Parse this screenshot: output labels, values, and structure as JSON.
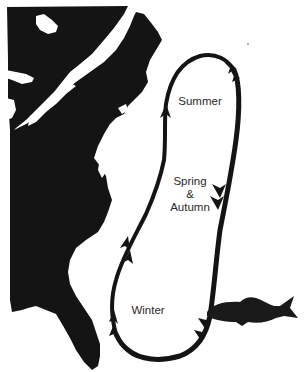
{
  "diagram": {
    "type": "migration-map",
    "labels": {
      "summer": "Summer",
      "spring_line1": "Spring",
      "spring_line2": "&",
      "spring_line3": "Autumn",
      "winter": "Winter"
    },
    "elements": {
      "map": "us-east-coast-silhouette",
      "path": "migration-loop",
      "animal": "fish-silhouette"
    },
    "colors": {
      "land": "#141414",
      "path": "#141414",
      "fish": "#1a1a1a",
      "background": "#ffffff",
      "text": "#2a2a2a"
    }
  }
}
